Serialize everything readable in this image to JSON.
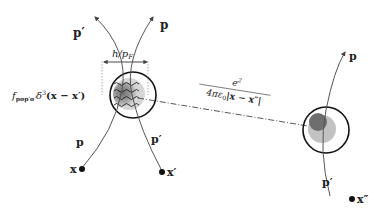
{
  "diagram": {
    "labels": {
      "p_prime_top": "p′",
      "p_top": "p",
      "width_label": "h/p",
      "width_label_sub": "F",
      "exchange_term": "f",
      "exchange_sub": "pσp′σ′",
      "exchange_delta": "δ",
      "exchange_delta_sup": "3",
      "exchange_args": "(x − x′)",
      "p_bottom_left": "p",
      "p_prime_bottom": "p′",
      "x_left": "x",
      "x_prime": "x′",
      "coulomb_num": "e",
      "coulomb_num_sup": "2",
      "coulomb_den": "4πε",
      "coulomb_den_sub": "0",
      "coulomb_den_abs": "|x − x″|",
      "p_right_top": "p",
      "p_prime_right": "p′",
      "x_double_prime": "x″"
    },
    "colors": {
      "line": "#555555",
      "circle": "#111111",
      "blob_dark": "#777777",
      "blob_light": "#c8c8c8",
      "dots": "#111111"
    }
  }
}
